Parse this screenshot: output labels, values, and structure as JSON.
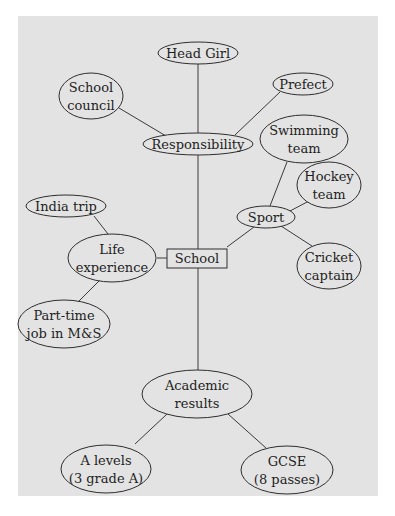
{
  "diagram": {
    "type": "mind-map",
    "background": "#e3e3e3",
    "root": {
      "id": "school",
      "label": "School",
      "shape": "rectangle"
    },
    "nodes": {
      "head_girl": {
        "lines": [
          "Head Girl"
        ]
      },
      "school_council": {
        "lines": [
          "School",
          "council"
        ]
      },
      "prefect": {
        "lines": [
          "Prefect"
        ]
      },
      "responsibility": {
        "lines": [
          "Responsibility"
        ]
      },
      "swimming_team": {
        "lines": [
          "Swimming",
          "team"
        ]
      },
      "hockey_team": {
        "lines": [
          "Hockey",
          "team"
        ]
      },
      "sport": {
        "lines": [
          "Sport"
        ]
      },
      "cricket_captain": {
        "lines": [
          "Cricket",
          "captain"
        ]
      },
      "india_trip": {
        "lines": [
          "India trip"
        ]
      },
      "life_experience": {
        "lines": [
          "Life",
          "experience"
        ]
      },
      "part_time_job": {
        "lines": [
          "Part-time",
          "job in M&S"
        ]
      },
      "academic_results": {
        "lines": [
          "Academic",
          "results"
        ]
      },
      "a_levels": {
        "lines": [
          "A levels",
          "(3 grade A)"
        ]
      },
      "gcse": {
        "lines": [
          "GCSE",
          "(8 passes)"
        ]
      }
    },
    "edges": [
      [
        "school",
        "responsibility"
      ],
      [
        "responsibility",
        "head_girl"
      ],
      [
        "responsibility",
        "school_council"
      ],
      [
        "responsibility",
        "prefect"
      ],
      [
        "school",
        "sport"
      ],
      [
        "sport",
        "swimming_team"
      ],
      [
        "sport",
        "hockey_team"
      ],
      [
        "sport",
        "cricket_captain"
      ],
      [
        "school",
        "life_experience"
      ],
      [
        "life_experience",
        "india_trip"
      ],
      [
        "life_experience",
        "part_time_job"
      ],
      [
        "school",
        "academic_results"
      ],
      [
        "academic_results",
        "a_levels"
      ],
      [
        "academic_results",
        "gcse"
      ]
    ]
  }
}
